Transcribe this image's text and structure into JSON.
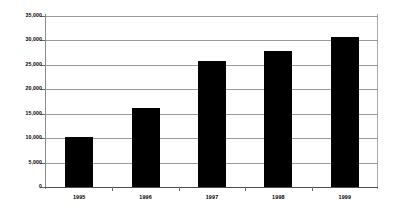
{
  "chart_data": {
    "type": "bar",
    "title": "",
    "subtitle": "",
    "xlabel": "",
    "ylabel": "",
    "categories": [
      "1995",
      "1996",
      "1997",
      "1998",
      "1999"
    ],
    "values": [
      10200,
      16200,
      25800,
      27900,
      30800
    ],
    "series": [
      {
        "name": "",
        "values": [
          10200,
          16200,
          25800,
          27900,
          30800
        ]
      }
    ],
    "ylim": [
      0,
      35000
    ],
    "y_ticks": [
      0,
      5000,
      10000,
      15000,
      20000,
      25000,
      30000,
      35000
    ],
    "y_tick_labels": [
      "0",
      "5,000",
      "10,000",
      "15,000",
      "20,000",
      "25,000",
      "30,000",
      "35,000"
    ],
    "x_tick_labels": [
      "1995",
      "1996",
      "1997",
      "1998",
      "1999"
    ],
    "grid": true,
    "grid_axis": "y",
    "legend": false,
    "legend_position": "none",
    "annotations": [],
    "colors": {
      "bar": "#000000",
      "background": "#ffffff",
      "gridline": "#9a9a9a",
      "axis": "#6a6a6a",
      "text": "#000000"
    }
  }
}
